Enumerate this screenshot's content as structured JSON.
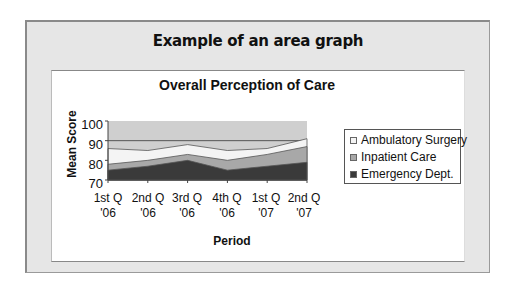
{
  "header": {
    "title": "Example of an area graph"
  },
  "chart_data": {
    "type": "area",
    "title": "Overall Perception of Care",
    "xlabel": "Period",
    "ylabel": "Mean Score",
    "ylim": [
      70,
      100
    ],
    "yticks": [
      "100",
      "90",
      "80",
      "70"
    ],
    "grid": true,
    "legend_position": "right",
    "categories": [
      {
        "line1": "1st Q",
        "line2": "'06"
      },
      {
        "line1": "2nd Q",
        "line2": "'06"
      },
      {
        "line1": "3rd Q",
        "line2": "'06"
      },
      {
        "line1": "4th Q",
        "line2": "'06"
      },
      {
        "line1": "1st Q",
        "line2": "'07"
      },
      {
        "line1": "2nd Q",
        "line2": "'07"
      }
    ],
    "series": [
      {
        "name": "Ambulatory Surgery",
        "color": "#f4f4f4",
        "values": [
          86,
          85,
          88,
          85,
          86,
          91
        ]
      },
      {
        "name": "Inpatient Care",
        "color": "#a8a8a8",
        "values": [
          78,
          80,
          83,
          80,
          83,
          87
        ]
      },
      {
        "name": "Emergency Dept.",
        "color": "#3a3a3a",
        "values": [
          75,
          77,
          80,
          75,
          77,
          79
        ]
      }
    ],
    "plot_background": "#cfcfcf"
  }
}
